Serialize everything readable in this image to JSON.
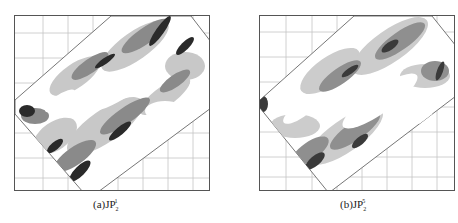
{
  "figure": {
    "panels": [
      {
        "id": "a",
        "caption": {
          "prefix": "(a)JP",
          "subscript": "2",
          "superscript": "1"
        },
        "grid": {
          "cols": 8,
          "rows": 7
        },
        "colors": {
          "frame": "#555555",
          "grid": "#bbbbbb",
          "dark": "#2a2a2a",
          "mid": "#8a8a8a",
          "light": "#c8c8c8"
        }
      },
      {
        "id": "b",
        "caption": {
          "prefix": "(b)JP",
          "subscript": "2",
          "superscript": "5"
        },
        "grid": {
          "cols": 8,
          "rows": 7
        },
        "colors": {
          "frame": "#555555",
          "grid": "#bbbbbb",
          "dark": "#3a3a3a",
          "mid": "#8f8f8f",
          "light": "#cccccc"
        }
      }
    ]
  }
}
